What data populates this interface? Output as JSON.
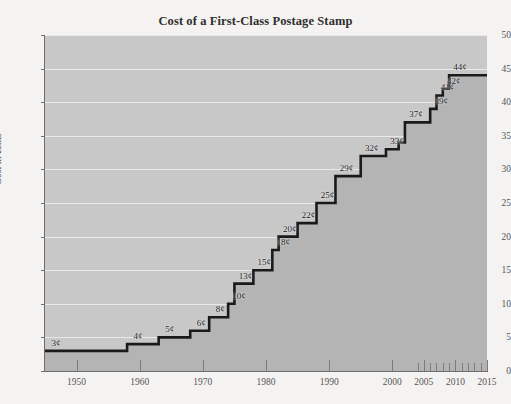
{
  "chart_data": {
    "type": "line",
    "title": "Cost of a First-Class Postage Stamp",
    "xlabel": "",
    "ylabel": "Cost in cents",
    "xlim": [
      1945,
      2015
    ],
    "ylim": [
      0,
      50
    ],
    "grid": true,
    "legend": false,
    "step_style": "post",
    "y_ticks": [
      0,
      5,
      10,
      15,
      20,
      25,
      30,
      35,
      40,
      45,
      50
    ],
    "x_ticks": [
      1950,
      1960,
      1970,
      1980,
      1990,
      2000,
      2005,
      2010,
      2015
    ],
    "x_minor_ticks": [
      2004,
      2005,
      2006,
      2007,
      2008,
      2009,
      2010,
      2011,
      2012,
      2013,
      2014,
      2015
    ],
    "x": [
      1945,
      1958,
      1963,
      1968,
      1971,
      1974,
      1975,
      1978,
      1981,
      1982,
      1985,
      1988,
      1991,
      1995,
      1999,
      2001,
      2002,
      2006,
      2007,
      2008,
      2009,
      2013
    ],
    "values": [
      3,
      4,
      5,
      6,
      8,
      10,
      13,
      15,
      18,
      20,
      22,
      25,
      29,
      32,
      33,
      34,
      37,
      39,
      41,
      42,
      44,
      44
    ],
    "point_labels": [
      {
        "year": 1945,
        "value": 3,
        "text": "3¢"
      },
      {
        "year": 1958,
        "value": 4,
        "text": "4¢"
      },
      {
        "year": 1963,
        "value": 5,
        "text": "5¢"
      },
      {
        "year": 1968,
        "value": 6,
        "text": "6¢"
      },
      {
        "year": 1971,
        "value": 8,
        "text": "8¢"
      },
      {
        "year": 1974,
        "value": 10,
        "text": "10¢"
      },
      {
        "year": 1975,
        "value": 13,
        "text": "13¢"
      },
      {
        "year": 1978,
        "value": 15,
        "text": "15¢"
      },
      {
        "year": 1981,
        "value": 18,
        "text": "18¢"
      },
      {
        "year": 1982,
        "value": 20,
        "text": "20¢"
      },
      {
        "year": 1985,
        "value": 22,
        "text": "22¢"
      },
      {
        "year": 1988,
        "value": 25,
        "text": "25¢"
      },
      {
        "year": 1991,
        "value": 29,
        "text": "29¢"
      },
      {
        "year": 1995,
        "value": 32,
        "text": "32¢"
      },
      {
        "year": 1999,
        "value": 33,
        "text": "33¢"
      },
      {
        "year": 2002,
        "value": 37,
        "text": "37¢"
      },
      {
        "year": 2006,
        "value": 39,
        "text": "39¢"
      },
      {
        "year": 2007,
        "value": 41,
        "text": "41¢"
      },
      {
        "year": 2008,
        "value": 42,
        "text": "42¢"
      },
      {
        "year": 2009,
        "value": 44,
        "text": "44¢"
      }
    ],
    "colors": {
      "page_background": "#f4f3f1",
      "plot_background": "#c8c8c8",
      "area_fill": "#b4b4b4",
      "gridline": "#efefef",
      "line": "#1a1a1a",
      "axis": "#6d6d6d",
      "text": "#3a3a3a"
    }
  }
}
